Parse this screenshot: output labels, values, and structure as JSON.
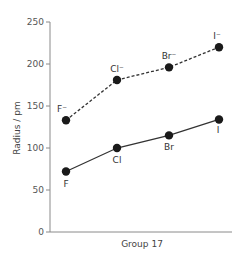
{
  "chart_data": {
    "type": "line",
    "title": "",
    "xlabel": "Group 17",
    "ylabel": "Radius / pm",
    "ylim": [
      0,
      250
    ],
    "yticks": [
      0,
      50,
      100,
      150,
      200,
      250
    ],
    "grid": false,
    "legend": null,
    "categories": [
      "F",
      "Cl",
      "Br",
      "I"
    ],
    "series": [
      {
        "name": "Ionic radius (X⁻)",
        "style": "dashed",
        "labels": [
          "F⁻",
          "Cl⁻",
          "Br⁻",
          "I⁻"
        ],
        "values": [
          133,
          181,
          196,
          220
        ]
      },
      {
        "name": "Atomic radius (X)",
        "style": "solid",
        "labels": [
          "F",
          "Cl",
          "Br",
          "I"
        ],
        "values": [
          72,
          100,
          115,
          134
        ]
      }
    ]
  },
  "colors": {
    "axis": "#8a8a8a",
    "line": "#333333",
    "marker": "#1a1a1a"
  }
}
